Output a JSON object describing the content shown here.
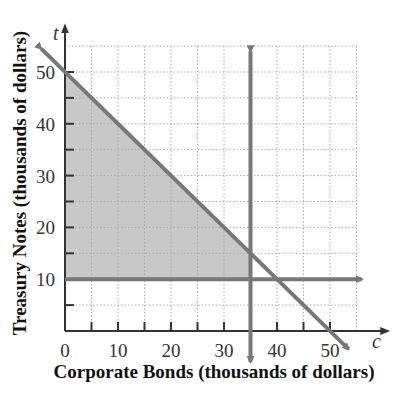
{
  "chart_data": {
    "type": "line",
    "title": "",
    "xlabel": "Corporate Bonds (thousands of dollars)",
    "ylabel": "Treasury Notes (thousands of dollars)",
    "x_variable": "c",
    "y_variable": "t",
    "xlim": [
      0,
      55
    ],
    "ylim": [
      0,
      55
    ],
    "x_ticks": [
      0,
      10,
      20,
      30,
      40,
      50
    ],
    "y_ticks": [
      10,
      20,
      30,
      40,
      50
    ],
    "x_tick_labels": [
      "0",
      "10",
      "20",
      "30",
      "40",
      "50"
    ],
    "y_tick_labels": [
      "10",
      "20",
      "30",
      "40",
      "50"
    ],
    "grid": true,
    "grid_step": 5,
    "series": [
      {
        "name": "c + t = 50",
        "type": "line",
        "points": [
          [
            0,
            50
          ],
          [
            50,
            0
          ]
        ]
      },
      {
        "name": "c = 35",
        "type": "vertical_line",
        "x": 35
      },
      {
        "name": "t = 10",
        "type": "horizontal_line",
        "y": 10
      }
    ],
    "shaded_region": {
      "description": "Feasible region: c >= 0, t >= 10, c <= 35, c + t <= 50",
      "vertices": [
        [
          0,
          10
        ],
        [
          0,
          50
        ],
        [
          35,
          15
        ],
        [
          35,
          10
        ]
      ],
      "color": "#c8c8c8"
    },
    "colors": {
      "lines": "#777777",
      "axes": "#333333",
      "grid": "#aaaaaa",
      "shade": "#c8c8c8"
    }
  }
}
